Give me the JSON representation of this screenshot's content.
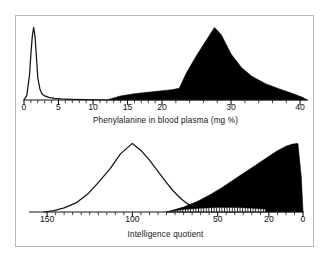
{
  "figure": {
    "title_visible": false,
    "background_color": "#ffffff",
    "frame_color": "#b9b9b9",
    "ink_color": "#000000"
  },
  "chart_data": [
    {
      "type": "area",
      "panel": "top",
      "title": "",
      "xlabel": "Phenylalanine in blood plasma (mg %)",
      "ylabel": "",
      "xlim": [
        0,
        41
      ],
      "ylim": [
        0,
        1
      ],
      "grid": false,
      "legend": "none",
      "x_ticks_major": [
        0,
        5,
        10,
        15,
        20,
        30,
        40
      ],
      "x_tick_labels": [
        "0",
        "5",
        "10",
        "15",
        "20",
        "30",
        "40"
      ],
      "x_ticks_minor": [
        1,
        2,
        3,
        4,
        6,
        7,
        8,
        9,
        11,
        12,
        13,
        14,
        16,
        17,
        18,
        19,
        22,
        24,
        26,
        28,
        32,
        34,
        36,
        38
      ],
      "series": [
        {
          "name": "Normal population",
          "style": "line",
          "fill": "none",
          "stroke": "#141414",
          "x": [
            0.0,
            0.4,
            0.8,
            1.0,
            1.2,
            1.4,
            1.6,
            1.8,
            2.0,
            2.3,
            2.6,
            3.0,
            3.6,
            4.4,
            5.4,
            7.0,
            9.0,
            12.0
          ],
          "values": [
            0.0,
            0.06,
            0.34,
            0.62,
            0.86,
            0.98,
            0.86,
            0.58,
            0.3,
            0.15,
            0.085,
            0.055,
            0.035,
            0.022,
            0.014,
            0.008,
            0.004,
            0.0
          ]
        },
        {
          "name": "Phenylketonuric population",
          "style": "filled",
          "fill": "#000000",
          "stroke": "#000000",
          "x": [
            12.0,
            14.0,
            16.0,
            18.0,
            20.0,
            21.5,
            22.5,
            23.5,
            25.0,
            26.5,
            27.6,
            28.6,
            30.0,
            31.5,
            33.0,
            35.0,
            37.0,
            39.0,
            40.5,
            41.0
          ],
          "values": [
            0.0,
            0.055,
            0.085,
            0.105,
            0.125,
            0.14,
            0.16,
            0.36,
            0.6,
            0.82,
            0.98,
            0.88,
            0.62,
            0.44,
            0.32,
            0.22,
            0.15,
            0.085,
            0.03,
            0.0
          ]
        }
      ]
    },
    {
      "type": "area",
      "panel": "bottom",
      "title": "",
      "xlabel": "Intelligence quotient",
      "ylabel": "",
      "xlim": [
        160,
        0
      ],
      "ylim": [
        0,
        1
      ],
      "grid": false,
      "legend": "none",
      "axis_direction": "descending",
      "x_ticks_major": [
        150,
        100,
        50,
        20,
        0
      ],
      "x_tick_labels": [
        "150",
        "100",
        "50",
        "20",
        "0"
      ],
      "x_ticks_minor": [
        145,
        140,
        135,
        130,
        125,
        120,
        115,
        110,
        105,
        95,
        90,
        85,
        80,
        75,
        70,
        65,
        60,
        55,
        45,
        40,
        35,
        30,
        25,
        15,
        10,
        5
      ],
      "series": [
        {
          "name": "Normal population",
          "style": "line",
          "fill": "none",
          "stroke": "#141414",
          "x": [
            152,
            146,
            140,
            133,
            126,
            120,
            113,
            107,
            100,
            95,
            90,
            85,
            80,
            76,
            72,
            68,
            62,
            55,
            48,
            42
          ],
          "values": [
            0.0,
            0.02,
            0.06,
            0.13,
            0.26,
            0.42,
            0.62,
            0.83,
            0.98,
            0.88,
            0.74,
            0.58,
            0.42,
            0.3,
            0.2,
            0.12,
            0.06,
            0.025,
            0.008,
            0.0
          ]
        },
        {
          "name": "Phenylketonuric population",
          "style": "filled",
          "fill": "#000000",
          "stroke": "#000000",
          "x": [
            80,
            70,
            62,
            55,
            48,
            40,
            32,
            24,
            16,
            10,
            6,
            3,
            1,
            0
          ],
          "values": [
            0.0,
            0.07,
            0.15,
            0.24,
            0.34,
            0.47,
            0.6,
            0.73,
            0.86,
            0.94,
            0.97,
            0.98,
            0.5,
            0.0
          ]
        },
        {
          "name": "Hatched overlap band",
          "style": "hatched",
          "fill": "hatch-vertical",
          "stroke": "#141414",
          "x": [
            80,
            70,
            60,
            50,
            40,
            30,
            22
          ],
          "values": [
            0.0,
            0.035,
            0.055,
            0.065,
            0.065,
            0.055,
            0.04
          ]
        }
      ]
    }
  ]
}
